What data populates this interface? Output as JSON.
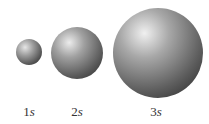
{
  "diagram": {
    "title": "",
    "orbitals": [
      {
        "label_num": "1",
        "label_letter": "s",
        "cx": 29,
        "cy": 52,
        "r": 13
      },
      {
        "label_num": "2",
        "label_letter": "s",
        "cx": 77,
        "cy": 53,
        "r": 26
      },
      {
        "label_num": "3",
        "label_letter": "s",
        "cx": 158,
        "cy": 53,
        "r": 45
      }
    ],
    "colors": {
      "highlight": "#e8e8e8",
      "mid": "#8a8a8a",
      "shadow": "#2a2a2a"
    }
  }
}
